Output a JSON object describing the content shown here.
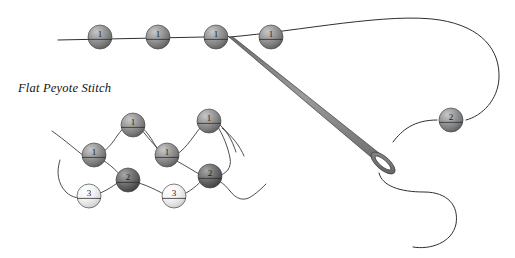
{
  "figure": {
    "caption": "Flat Peyote Stitch",
    "caption_pos": {
      "x": 18,
      "y": 92
    },
    "background_color": "#ffffff",
    "thread_color": "#2f2f2f",
    "needle_color": "#8a8a8a",
    "needle_outline_color": "#3d3d3d"
  },
  "bead_styles": {
    "dark": {
      "name": "dark-gray-bead",
      "light": "#b9b9b9",
      "mid": "#8f8f8f",
      "dark": "#5e5e5e",
      "edge": "#4a4a4a"
    },
    "darker": {
      "name": "darker-gray-bead",
      "light": "#9d9d9d",
      "mid": "#6f6f6f",
      "dark": "#3f3f3f",
      "edge": "#333333"
    },
    "pale": {
      "name": "pale-white-bead",
      "light": "#fcfcfc",
      "mid": "#eaeaea",
      "dark": "#c6c6c6",
      "edge": "#9a9a9a"
    }
  },
  "top_row": {
    "name": "top-bead-row",
    "beads": [
      {
        "label": "1",
        "cx": 100,
        "cy": 37,
        "r": 12,
        "style": "dark"
      },
      {
        "label": "1",
        "cx": 158,
        "cy": 37,
        "r": 12,
        "style": "dark"
      },
      {
        "label": "1",
        "cx": 216,
        "cy": 37,
        "r": 12,
        "style": "dark"
      },
      {
        "label": "1",
        "cx": 271,
        "cy": 37,
        "r": 12,
        "style": "dark"
      }
    ],
    "thread_path": "M 58 40 L 229 36.5"
  },
  "right_section": {
    "name": "needle-and-loop",
    "beads": [
      {
        "label": "2",
        "cx": 451,
        "cy": 120,
        "r": 12,
        "style": "dark"
      }
    ],
    "loop_path": "M 230 37 C 300 31 390 12 440 20 C 482 27 500 50 499 78 C 498 100 482 116 466 120",
    "tail_path": "M 437 120 C 414 120 402 130 393 142",
    "needle": {
      "tip": {
        "x": 229,
        "y": 37
      },
      "eye_center": {
        "x": 383,
        "y": 163
      },
      "body_path": "M 229 37 L 233.5 37.5 L 389 161 L 384 168 Z",
      "eye_outer_rx": 15,
      "eye_outer_ry": 6.5,
      "eye_inner_rx": 10,
      "eye_inner_ry": 3.2,
      "eye_rotation": 41
    },
    "lower_tail_path": "M 379 173 C 382 186 400 192 424 192 C 448 192 459 206 456 224 C 452 243 430 250 413 247"
  },
  "lower_cluster": {
    "name": "peyote-weave-cluster",
    "beads": [
      {
        "label": "1",
        "cx": 94,
        "cy": 155,
        "r": 12,
        "style": "dark"
      },
      {
        "label": "1",
        "cx": 133,
        "cy": 125,
        "r": 12,
        "style": "dark"
      },
      {
        "label": "1",
        "cx": 167,
        "cy": 155,
        "r": 12,
        "style": "dark"
      },
      {
        "label": "1",
        "cx": 209,
        "cy": 121,
        "r": 12,
        "style": "dark"
      },
      {
        "label": "2",
        "cx": 128,
        "cy": 180,
        "r": 12,
        "style": "darker"
      },
      {
        "label": "2",
        "cx": 210,
        "cy": 176,
        "r": 12,
        "style": "darker"
      },
      {
        "label": "3",
        "cx": 89,
        "cy": 196,
        "r": 12,
        "style": "pale"
      },
      {
        "label": "3",
        "cx": 174,
        "cy": 196,
        "r": 12,
        "style": "pale"
      }
    ],
    "threads": [
      "M 52 131 C 66 141 76 150 84 156",
      "M 84 156 C 99 158 108 150 117 136 C 124 126 130 122 136 124",
      "M 136 124 C 146 128 152 140 158 150 C 162 156 166 158 172 157",
      "M 172 157 C 184 152 192 138 200 128 C 205 122 210 120 216 122",
      "M 216 122 C 226 128 232 140 236 152",
      "M 60 160 C 56 172 58 184 66 192 C 72 198 80 199 88 197",
      "M 88 197 C 102 194 112 187 120 181",
      "M 120 181 C 136 180 148 186 160 192 C 166 196 172 198 178 197",
      "M 178 197 C 190 192 198 185 204 178",
      "M 204 178 C 216 177 224 183 230 191",
      "M 230 191 C 236 199 244 202 252 196 C 258 192 262 188 266 184",
      "M 94 156 C 106 160 116 170 124 179",
      "M 167 156 C 180 162 192 170 204 177",
      "M 140 128 C 150 140 158 150 166 156",
      "M 216 124 C 224 136 228 148 230 158 C 232 168 226 174 218 176",
      "M 222 128 C 232 136 240 146 244 156"
    ]
  }
}
